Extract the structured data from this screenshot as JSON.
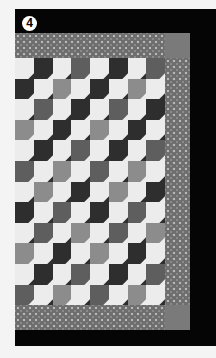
{
  "image": {
    "subject": "Bow-tie patchwork quilt photographed on black background",
    "step_badge": "4",
    "palette": {
      "page_background": "#f4f4f4",
      "photo_background": "#050505",
      "white_patch": "#ececec",
      "light_gray_patch": "#8c8c8c",
      "mid_gray_patch": "#5e5e5e",
      "dark_gray_patch": "#2e2e2e",
      "border_fabric": "#6e6e6e",
      "corner_square": "#7a7a7a"
    },
    "regions": [
      "top border",
      "right border",
      "bottom border",
      "top-right corner square",
      "bottom-right corner square",
      "bow-tie patchwork center"
    ]
  },
  "patchwork": {
    "rows": [
      [
        "w",
        "d",
        "w",
        "m",
        "w",
        "d",
        "w",
        "m"
      ],
      [
        "d",
        "w",
        "l",
        "w",
        "d",
        "w",
        "l",
        "w"
      ],
      [
        "w",
        "m",
        "w",
        "d",
        "w",
        "m",
        "w",
        "d"
      ],
      [
        "l",
        "w",
        "d",
        "w",
        "l",
        "w",
        "d",
        "w"
      ],
      [
        "w",
        "d",
        "w",
        "m",
        "w",
        "d",
        "w",
        "m"
      ],
      [
        "m",
        "w",
        "l",
        "w",
        "m",
        "w",
        "l",
        "w"
      ],
      [
        "w",
        "l",
        "w",
        "d",
        "w",
        "l",
        "w",
        "d"
      ],
      [
        "d",
        "w",
        "m",
        "w",
        "d",
        "w",
        "m",
        "w"
      ],
      [
        "w",
        "m",
        "w",
        "l",
        "w",
        "m",
        "w",
        "l"
      ],
      [
        "l",
        "w",
        "d",
        "w",
        "l",
        "w",
        "d",
        "w"
      ],
      [
        "w",
        "d",
        "w",
        "m",
        "w",
        "d",
        "w",
        "m"
      ],
      [
        "m",
        "w",
        "l",
        "w",
        "m",
        "w",
        "l",
        "w"
      ]
    ]
  }
}
